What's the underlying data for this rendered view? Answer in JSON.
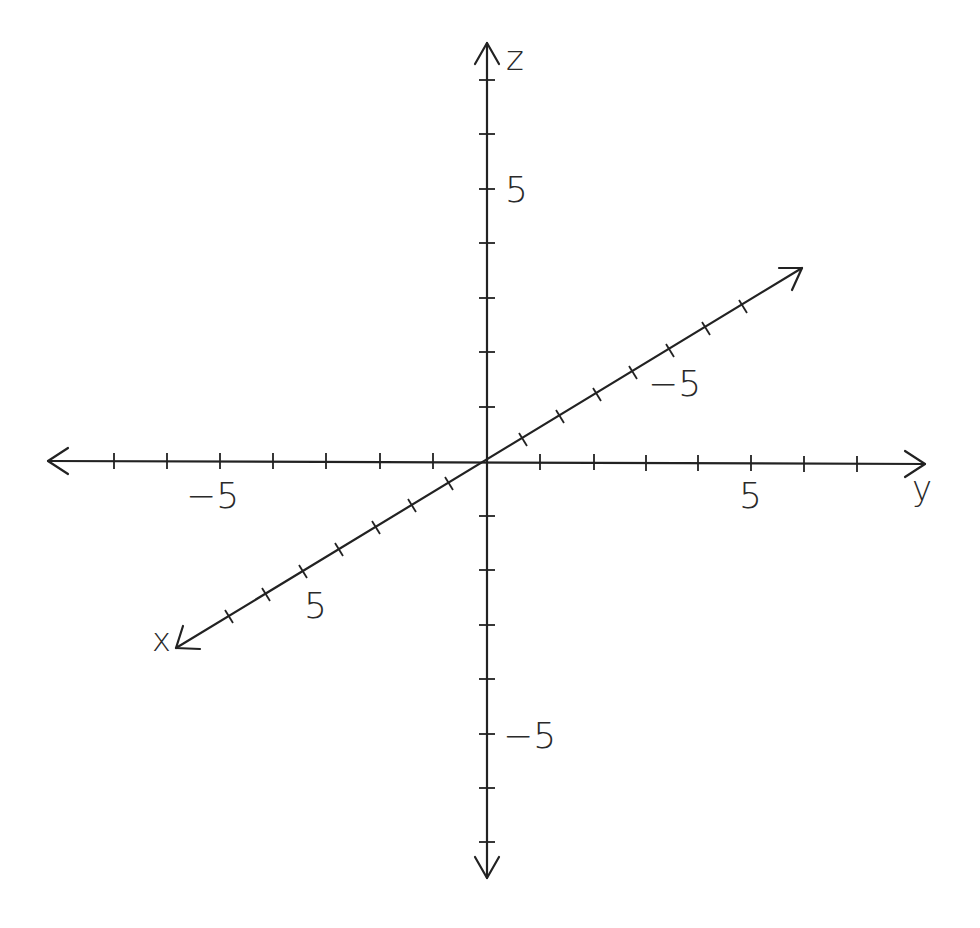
{
  "diagram": {
    "type": "3d-coordinate-axes",
    "background": "#ffffff",
    "line_color": "#222222",
    "origin": {
      "x": 486,
      "y": 461
    },
    "axes": {
      "x": {
        "label": "x",
        "tick_label_positive": "5",
        "ticks_each_side": 7
      },
      "y": {
        "label": "y",
        "tick_label_positive": "5",
        "tick_label_negative": "−5",
        "ticks_each_side": 7
      },
      "z": {
        "label": "z",
        "tick_label_positive": "5",
        "tick_label_negative": "−5",
        "ticks_each_side": 7
      },
      "x_back": {
        "tick_label_negative": "−5"
      }
    }
  }
}
